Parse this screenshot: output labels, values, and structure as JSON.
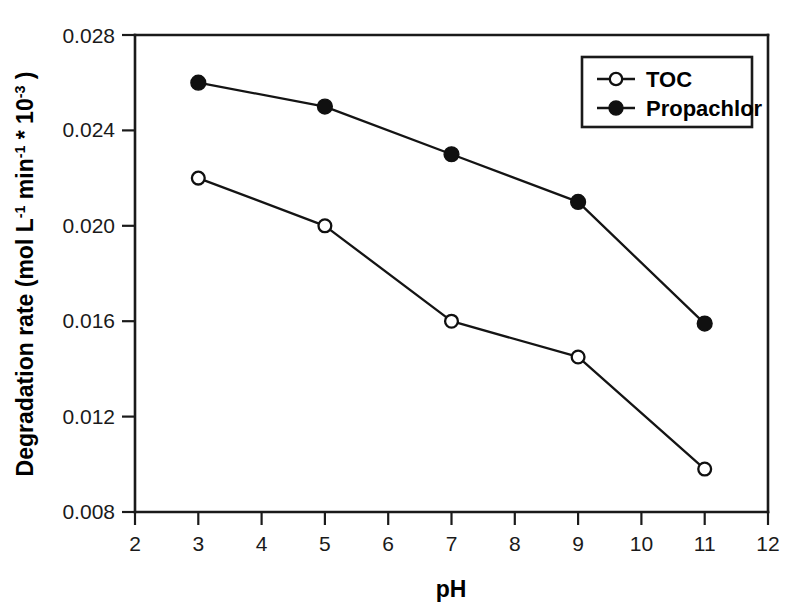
{
  "chart_data": {
    "type": "line",
    "title": "",
    "xlabel": "pH",
    "ylabel": "Degradation rate (mol L-1 min-1 * 10-3 )",
    "ylabel_parts": {
      "main": "Degradation rate (mol L",
      "sup1": "-1",
      "mid1": " min",
      "sup2": "-1",
      "mid2": " * 10",
      "sup3": "-3",
      "tail": " )"
    },
    "x": [
      3,
      5,
      7,
      9,
      11
    ],
    "xlim": [
      2,
      12
    ],
    "ylim": [
      0.008,
      0.028
    ],
    "xticks": [
      2,
      3,
      4,
      5,
      6,
      7,
      8,
      9,
      10,
      11,
      12
    ],
    "xtick_labels": [
      "2",
      "3",
      "4",
      "5",
      "6",
      "7",
      "8",
      "9",
      "10",
      "11",
      "12"
    ],
    "yticks": [
      0.008,
      0.012,
      0.016,
      0.02,
      0.024,
      0.028
    ],
    "ytick_labels": [
      "0.008",
      "0.012",
      "0.016",
      "0.020",
      "0.024",
      "0.028"
    ],
    "grid": false,
    "legend_position": "top-right",
    "series": [
      {
        "name": "TOC",
        "marker": "open-circle",
        "values": [
          0.022,
          0.02,
          0.016,
          0.0145,
          0.0098
        ]
      },
      {
        "name": "Propachlor",
        "marker": "filled-circle",
        "values": [
          0.026,
          0.025,
          0.023,
          0.021,
          0.0159
        ]
      }
    ]
  },
  "legend": {
    "entries": [
      {
        "label": "TOC",
        "marker": "open-circle"
      },
      {
        "label": "Propachlor",
        "marker": "filled-circle"
      }
    ]
  },
  "colors": {
    "axis": "#1a1a1a",
    "series_line": "#141414",
    "marker_fill": "#101010",
    "marker_open_fill": "#ffffff",
    "background": "#ffffff"
  }
}
